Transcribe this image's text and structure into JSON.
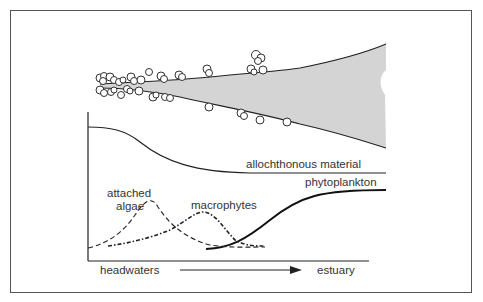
{
  "diagram": {
    "type": "river continuum - primary production sources",
    "labels": {
      "allochthonous": "allochthonous material",
      "phytoplankton": "phytoplankton",
      "attached_line1": "attached",
      "attached_line2": "algae",
      "macrophytes": "macrophytes",
      "headwaters": "headwaters",
      "estuary": "estuary"
    },
    "colors": {
      "river_fill": "#d4d4d4",
      "line": "#222222",
      "frame": "#555555",
      "text": "#333333"
    },
    "curves": [
      {
        "name": "allochthonous material",
        "style": "solid",
        "trend": "high at headwaters, declining to low plateau"
      },
      {
        "name": "phytoplankton",
        "style": "solid-thick",
        "trend": "rising from mid-river to high at estuary"
      },
      {
        "name": "attached algae",
        "style": "dashed",
        "trend": "peak in upper reaches"
      },
      {
        "name": "macrophytes",
        "style": "dash-dot",
        "trend": "peak in middle reaches"
      }
    ]
  }
}
